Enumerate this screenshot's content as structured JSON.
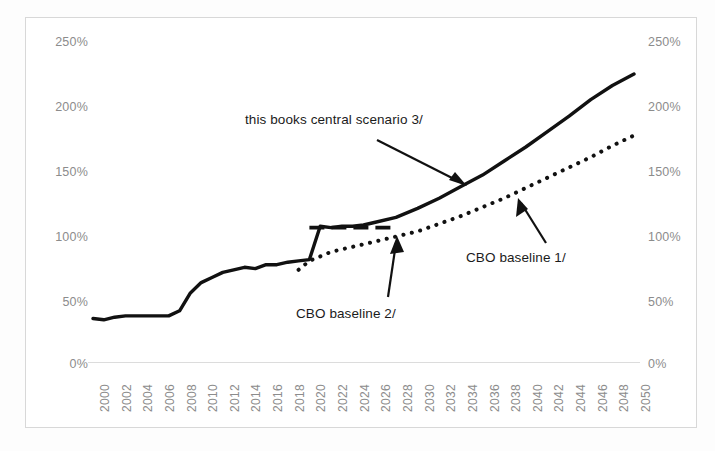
{
  "chart_data": {
    "type": "line",
    "title": "",
    "subtitle": "",
    "xlabel": "",
    "ylabel": "",
    "xlim": [
      2000,
      2050
    ],
    "ylim": [
      0,
      250
    ],
    "grid": false,
    "legend_position": "annotations-inline",
    "y_tick_labels": [
      "250%",
      "200%",
      "150%",
      "100%",
      "50%",
      "0%"
    ],
    "y_tick_values": [
      250,
      200,
      150,
      100,
      50,
      0
    ],
    "y_axis_left_labels": [
      "250%",
      "200%",
      "150%",
      "100%",
      "50%",
      "0%"
    ],
    "y_axis_right_labels": [
      "250%",
      "200%",
      "150%",
      "100%",
      "50%",
      "0%"
    ],
    "x_tick_labels": [
      "2000",
      "2002",
      "2004",
      "2006",
      "2008",
      "2010",
      "2012",
      "2014",
      "2016",
      "2018",
      "2020",
      "2022",
      "2024",
      "2026",
      "2028",
      "2030",
      "2032",
      "2034",
      "2036",
      "2038",
      "2040",
      "2042",
      "2044",
      "2046",
      "2048",
      "2050"
    ],
    "x_tick_values": [
      2000,
      2002,
      2004,
      2006,
      2008,
      2010,
      2012,
      2014,
      2016,
      2018,
      2020,
      2022,
      2024,
      2026,
      2028,
      2030,
      2032,
      2034,
      2036,
      2038,
      2040,
      2042,
      2044,
      2046,
      2048,
      2050
    ],
    "series": [
      {
        "name": "this books central scenario 3/",
        "style": "solid",
        "color": "#111111",
        "x": [
          2000,
          2001,
          2002,
          2003,
          2004,
          2005,
          2006,
          2007,
          2008,
          2009,
          2010,
          2011,
          2012,
          2013,
          2014,
          2015,
          2016,
          2017,
          2018,
          2019,
          2020,
          2021,
          2022,
          2023,
          2024,
          2025,
          2026,
          2028,
          2030,
          2032,
          2034,
          2036,
          2038,
          2040,
          2042,
          2044,
          2046,
          2048,
          2050
        ],
        "y": [
          34,
          33,
          35,
          36,
          36,
          36,
          36,
          36,
          40,
          54,
          62,
          66,
          70,
          72,
          74,
          73,
          76,
          76,
          78,
          79,
          80,
          106,
          105,
          106,
          106,
          107,
          109,
          113,
          120,
          128,
          137,
          146,
          157,
          168,
          180,
          192,
          205,
          216,
          225
        ]
      },
      {
        "name": "CBO baseline 1/",
        "style": "dotted",
        "color": "#111111",
        "x": [
          2019,
          2020,
          2022,
          2024,
          2026,
          2028,
          2030,
          2032,
          2034,
          2036,
          2038,
          2040,
          2042,
          2044,
          2046,
          2048,
          2050
        ],
        "y": [
          72,
          79,
          86,
          90,
          94,
          98,
          102,
          108,
          114,
          121,
          128,
          136,
          144,
          152,
          160,
          169,
          177
        ]
      },
      {
        "name": "CBO baseline 2/",
        "style": "dashed",
        "color": "#111111",
        "x": [
          2020,
          2021,
          2022,
          2023,
          2024,
          2025,
          2026,
          2027,
          2028
        ],
        "y": [
          105,
          105,
          105,
          105,
          105,
          105,
          105,
          105,
          105
        ]
      }
    ],
    "annotations": [
      {
        "name": "this-books-central-scenario",
        "text": "this books central scenario 3/",
        "points_to_x": 2035,
        "points_to_y": 144
      },
      {
        "name": "cbo-baseline-1",
        "text": "CBO baseline 1/",
        "points_to_x": 2038,
        "points_to_y": 124
      },
      {
        "name": "CBO baseline 2",
        "text": "CBO baseline 2/",
        "points_to_x": 2028,
        "points_to_y": 102
      }
    ]
  },
  "annotations": {
    "central_scenario": "this books central scenario 3/",
    "cbo_baseline_1": "CBO baseline 1/",
    "cbo_baseline_2": "CBO baseline 2/"
  },
  "axis": {
    "y_left": [
      "250%",
      "200%",
      "150%",
      "100%",
      "50%",
      "0%"
    ],
    "y_right": [
      "250%",
      "200%",
      "150%",
      "100%",
      "50%",
      "0%"
    ],
    "x": [
      "2000",
      "2002",
      "2004",
      "2006",
      "2008",
      "2010",
      "2012",
      "2014",
      "2016",
      "2018",
      "2020",
      "2022",
      "2024",
      "2026",
      "2028",
      "2030",
      "2032",
      "2034",
      "2036",
      "2038",
      "2040",
      "2042",
      "2044",
      "2046",
      "2048",
      "2050"
    ]
  },
  "colors": {
    "line": "#111111",
    "tick_text": "#8c8c8c",
    "frame": "#d8d8d8",
    "background": "#ffffff"
  }
}
